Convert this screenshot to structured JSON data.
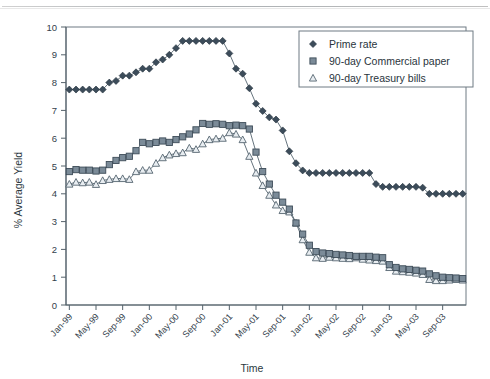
{
  "chart": {
    "type": "line",
    "ylabel": "% Average Yield",
    "xlabel": "Time"
  },
  "legend": {
    "position": "top-right",
    "items": [
      {
        "label": "Prime rate",
        "marker": "diamond",
        "color": "#3c4c5a"
      },
      {
        "label": "90-day Commercial paper",
        "marker": "square",
        "color": "#7b8b98"
      },
      {
        "label": "90-day Treasury bills",
        "marker": "triangle",
        "color": "#e8edf1"
      }
    ]
  },
  "chart_data": {
    "type": "line",
    "title": "",
    "xlabel": "Time",
    "ylabel": "% Average Yield",
    "ylim": [
      0,
      10
    ],
    "yticks": [
      0,
      1,
      2,
      3,
      4,
      5,
      6,
      7,
      8,
      9,
      10
    ],
    "grid": false,
    "legend_position": "top-right",
    "x_tick_labels": [
      "Jan-99",
      "May-99",
      "Sep-99",
      "Jan-00",
      "May-00",
      "Sep-00",
      "Jan-01",
      "May-01",
      "Sep-01",
      "Jan-02",
      "May-02",
      "Sep-02",
      "Jan-03",
      "May-03",
      "Sep-03"
    ],
    "x": [
      "Jan-99",
      "Feb-99",
      "Mar-99",
      "Apr-99",
      "May-99",
      "Jun-99",
      "Jul-99",
      "Aug-99",
      "Sep-99",
      "Oct-99",
      "Nov-99",
      "Dec-99",
      "Jan-00",
      "Feb-00",
      "Mar-00",
      "Apr-00",
      "May-00",
      "Jun-00",
      "Jul-00",
      "Aug-00",
      "Sep-00",
      "Oct-00",
      "Nov-00",
      "Dec-00",
      "Jan-01",
      "Feb-01",
      "Mar-01",
      "Apr-01",
      "May-01",
      "Jun-01",
      "Jul-01",
      "Aug-01",
      "Sep-01",
      "Oct-01",
      "Nov-01",
      "Dec-01",
      "Jan-02",
      "Feb-02",
      "Mar-02",
      "Apr-02",
      "May-02",
      "Jun-02",
      "Jul-02",
      "Aug-02",
      "Sep-02",
      "Oct-02",
      "Nov-02",
      "Dec-02",
      "Jan-03",
      "Feb-03",
      "Mar-03",
      "Apr-03",
      "May-03",
      "Jun-03",
      "Jul-03",
      "Aug-03",
      "Sep-03",
      "Oct-03",
      "Nov-03",
      "Dec-03"
    ],
    "series": [
      {
        "name": "Prime rate",
        "marker": "diamond",
        "color": "#3c4c5a",
        "values": [
          7.75,
          7.75,
          7.75,
          7.75,
          7.75,
          7.75,
          8.0,
          8.06,
          8.25,
          8.25,
          8.37,
          8.5,
          8.5,
          8.73,
          8.83,
          9.0,
          9.24,
          9.5,
          9.5,
          9.5,
          9.5,
          9.5,
          9.5,
          9.5,
          9.05,
          8.5,
          8.32,
          7.8,
          7.24,
          6.98,
          6.75,
          6.67,
          6.28,
          5.53,
          5.1,
          4.84,
          4.75,
          4.75,
          4.75,
          4.75,
          4.75,
          4.75,
          4.75,
          4.75,
          4.75,
          4.75,
          4.35,
          4.25,
          4.25,
          4.25,
          4.25,
          4.25,
          4.25,
          4.22,
          4.0,
          4.0,
          4.0,
          4.0,
          4.0,
          4.0
        ]
      },
      {
        "name": "90-day Commercial paper",
        "marker": "square",
        "color": "#7b8b98",
        "values": [
          4.8,
          4.87,
          4.85,
          4.85,
          4.82,
          4.85,
          5.05,
          5.2,
          5.3,
          5.35,
          5.55,
          5.85,
          5.8,
          5.85,
          5.9,
          5.85,
          5.95,
          6.05,
          6.15,
          6.3,
          6.53,
          6.5,
          6.52,
          6.5,
          6.45,
          6.47,
          6.45,
          6.33,
          5.5,
          4.8,
          4.35,
          3.95,
          3.7,
          3.45,
          2.95,
          2.55,
          2.15,
          1.92,
          1.87,
          1.85,
          1.82,
          1.8,
          1.78,
          1.75,
          1.75,
          1.75,
          1.72,
          1.7,
          1.45,
          1.35,
          1.3,
          1.28,
          1.25,
          1.22,
          1.12,
          1.05,
          1.0,
          0.98,
          0.97,
          0.95
        ]
      },
      {
        "name": "90-day Treasury bills",
        "marker": "triangle",
        "color": "#e8edf1",
        "values": [
          4.35,
          4.42,
          4.4,
          4.42,
          4.34,
          4.48,
          4.52,
          4.55,
          4.55,
          4.52,
          4.8,
          4.85,
          4.85,
          5.1,
          5.3,
          5.4,
          5.45,
          5.48,
          5.65,
          5.6,
          5.8,
          5.95,
          5.98,
          6.0,
          6.2,
          6.15,
          5.95,
          5.35,
          4.75,
          4.3,
          3.95,
          3.6,
          3.4,
          3.35,
          2.95,
          2.35,
          1.9,
          1.7,
          1.68,
          1.72,
          1.7,
          1.68,
          1.67,
          1.7,
          1.65,
          1.62,
          1.6,
          1.58,
          1.35,
          1.22,
          1.2,
          1.18,
          1.15,
          1.1,
          0.92,
          0.88,
          0.88,
          0.9,
          0.92,
          0.9
        ]
      }
    ]
  }
}
